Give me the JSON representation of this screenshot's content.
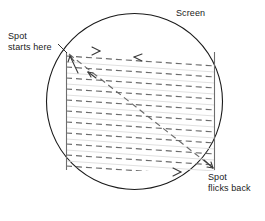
{
  "figure": {
    "width": 265,
    "height": 221,
    "background_color": "#ffffff"
  },
  "labels": {
    "screen": {
      "text": "Screen",
      "position": "top-right"
    },
    "spot_start": {
      "line1": "Spot",
      "line2": "starts here",
      "position": "top-left"
    },
    "spot_flicks_back": {
      "line1": "Spot",
      "line2": "flicks back",
      "position": "bottom-right"
    }
  },
  "colors": {
    "outline": "#1a1a1a",
    "scan_line": "#6b6b6b",
    "solid_rule": "#d9d9d9",
    "frame_edge": "#6e6e6e",
    "text": "#1a1a1a"
  },
  "geometry": {
    "circle": {
      "cx": 134.5,
      "cy": 101.5,
      "r": 88
    },
    "raster_rect": {
      "left": 66,
      "right": 215,
      "top": 52,
      "bottom": 170
    },
    "scan_line_count": 11,
    "scan_line_slope_px": 10,
    "dash_pattern": "6 4"
  },
  "annotations": {
    "arrow_top_right_marker": ">",
    "arrow_top_left_marker": "<",
    "arrow_bottom_right_marker": ">",
    "flyback_arrow_start": "up-left",
    "flyback_arrow_end": "down-right"
  }
}
